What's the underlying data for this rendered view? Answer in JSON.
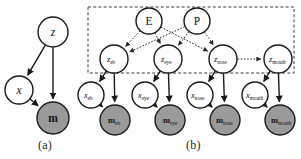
{
  "figure": {
    "captions": {
      "a": "(a)",
      "b": "(b)"
    },
    "colors": {
      "observed_fill": "#9a9a9a",
      "latent_fill": "#ffffff",
      "stroke": "#1a1a1a",
      "plate_stroke": "#3a3a3a",
      "background": "#ffffff"
    }
  },
  "panel_a": {
    "name": "global-model",
    "nodes": [
      {
        "id": "z",
        "label": "z",
        "shaded": false,
        "cx": 53,
        "cy": 32,
        "r": 15
      },
      {
        "id": "x",
        "label": "x",
        "shaded": false,
        "cx": 19,
        "cy": 90,
        "r": 14
      },
      {
        "id": "m",
        "label": "m",
        "shaded": true,
        "cx": 53,
        "cy": 118,
        "r": 16
      }
    ],
    "edges": [
      {
        "from": "z",
        "to": "x",
        "style": "solid"
      },
      {
        "from": "z",
        "to": "m",
        "style": "solid"
      },
      {
        "from": "x",
        "to": "m",
        "style": "solid"
      }
    ]
  },
  "panel_b": {
    "name": "part-based-model",
    "plate": {
      "x": 88,
      "y": 7,
      "width": 206,
      "height": 66,
      "style": "dashed"
    },
    "global_nodes": [
      {
        "id": "E",
        "label": "E",
        "shaded": false,
        "cx": 149,
        "cy": 21,
        "r": 13
      },
      {
        "id": "P",
        "label": "P",
        "shaded": false,
        "cx": 197,
        "cy": 21,
        "r": 13
      }
    ],
    "parts": [
      "eb",
      "eye",
      "nose",
      "mouth"
    ],
    "latent_nodes": [
      {
        "id": "z_eb",
        "base": "z",
        "sub": "eb",
        "shaded": false,
        "cx": 114,
        "cy": 59,
        "r": 14
      },
      {
        "id": "z_eye",
        "base": "z",
        "sub": "eye",
        "shaded": false,
        "cx": 168,
        "cy": 59,
        "r": 14
      },
      {
        "id": "z_nose",
        "base": "z",
        "sub": "nose",
        "shaded": false,
        "cx": 223,
        "cy": 59,
        "r": 14
      },
      {
        "id": "z_mouth",
        "base": "z",
        "sub": "mouth",
        "shaded": false,
        "cx": 278,
        "cy": 59,
        "r": 14
      }
    ],
    "x_nodes": [
      {
        "id": "x_eb",
        "base": "x",
        "sub": "eb",
        "shaded": false,
        "cx": 91,
        "cy": 95,
        "r": 13
      },
      {
        "id": "x_eye",
        "base": "x",
        "sub": "eye",
        "shaded": false,
        "cx": 145,
        "cy": 95,
        "r": 13
      },
      {
        "id": "x_nose",
        "base": "x",
        "sub": "nose",
        "shaded": false,
        "cx": 200,
        "cy": 95,
        "r": 13
      },
      {
        "id": "x_mouth",
        "base": "x",
        "sub": "mouth",
        "shaded": false,
        "cx": 255,
        "cy": 95,
        "r": 13
      }
    ],
    "m_nodes": [
      {
        "id": "m_eb",
        "base": "m",
        "sub": "eb",
        "shaded": true,
        "cx": 115,
        "cy": 120,
        "r": 15
      },
      {
        "id": "m_eye",
        "base": "m",
        "sub": "eye",
        "shaded": true,
        "cx": 170,
        "cy": 120,
        "r": 15
      },
      {
        "id": "m_nose",
        "base": "m",
        "sub": "nose",
        "shaded": true,
        "cx": 225,
        "cy": 120,
        "r": 15
      },
      {
        "id": "m_mouth",
        "base": "m",
        "sub": "mouth",
        "shaded": true,
        "cx": 280,
        "cy": 120,
        "r": 15
      }
    ],
    "edges": [
      {
        "from": "E",
        "to": "z_eb",
        "style": "dotted"
      },
      {
        "from": "E",
        "to": "z_eye",
        "style": "dotted"
      },
      {
        "from": "E",
        "to": "z_nose",
        "style": "dotted"
      },
      {
        "from": "P",
        "to": "z_eb",
        "style": "dotted"
      },
      {
        "from": "P",
        "to": "z_eye",
        "style": "dotted"
      },
      {
        "from": "P",
        "to": "z_nose",
        "style": "dotted"
      },
      {
        "from": "z_nose",
        "to": "z_mouth",
        "style": "dotted"
      },
      {
        "from": "z_eb",
        "to": "x_eb",
        "style": "solid"
      },
      {
        "from": "z_eye",
        "to": "x_eye",
        "style": "solid"
      },
      {
        "from": "z_nose",
        "to": "x_nose",
        "style": "solid"
      },
      {
        "from": "z_mouth",
        "to": "x_mouth",
        "style": "solid"
      },
      {
        "from": "z_eb",
        "to": "m_eb",
        "style": "solid"
      },
      {
        "from": "z_eye",
        "to": "m_eye",
        "style": "solid"
      },
      {
        "from": "z_nose",
        "to": "m_nose",
        "style": "solid"
      },
      {
        "from": "z_mouth",
        "to": "m_mouth",
        "style": "solid"
      },
      {
        "from": "x_eb",
        "to": "m_eb",
        "style": "solid"
      },
      {
        "from": "x_eye",
        "to": "m_eye",
        "style": "solid"
      },
      {
        "from": "x_nose",
        "to": "m_nose",
        "style": "solid"
      },
      {
        "from": "x_mouth",
        "to": "m_mouth",
        "style": "solid"
      }
    ]
  }
}
